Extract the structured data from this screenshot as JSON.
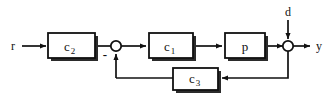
{
  "diagram": {
    "type": "control-block-diagram",
    "colors": {
      "line": "#111111",
      "block_fill": "#ffffff",
      "block_stroke": "#111111",
      "shadow": "#2b2b2b",
      "background": "#ffffff"
    },
    "signals": {
      "reference": "r",
      "disturbance": "d",
      "output": "y"
    },
    "summing_junctions": [
      {
        "id": "sum-error",
        "sign_label": "-",
        "inputs": [
          "r-path",
          "feedback"
        ],
        "output": "c1-path"
      },
      {
        "id": "sum-output",
        "sign_label": "",
        "inputs": [
          "p-path",
          "d"
        ],
        "output": "y"
      }
    ],
    "blocks": [
      {
        "id": "block-c2",
        "base": "c",
        "sub": "2",
        "full": "c2"
      },
      {
        "id": "block-c1",
        "base": "c",
        "sub": "1",
        "full": "c1"
      },
      {
        "id": "block-p",
        "base": "p",
        "sub": "",
        "full": "p"
      },
      {
        "id": "block-c3",
        "base": "c",
        "sub": "3",
        "full": "c3"
      }
    ]
  }
}
